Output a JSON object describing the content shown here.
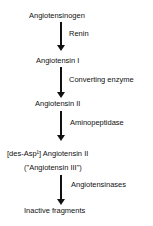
{
  "diagram": {
    "nodes": [
      {
        "id": "angiotensinogen",
        "label": "Angiotensinogen"
      },
      {
        "id": "angiotensin-1",
        "label": "Angiotensin I"
      },
      {
        "id": "angiotensin-2",
        "label": "Angiotensin II"
      },
      {
        "id": "des-asp-angiotensin-2",
        "label": "[des-Asp¹] Angiotensin II",
        "alias": "(\"Angiotensin III\")"
      },
      {
        "id": "inactive-fragments",
        "label": "Inactive fragments"
      }
    ],
    "edges": [
      {
        "from": "angiotensinogen",
        "to": "angiotensin-1",
        "label": "Renin"
      },
      {
        "from": "angiotensin-1",
        "to": "angiotensin-2",
        "label": "Converting enzyme"
      },
      {
        "from": "angiotensin-2",
        "to": "des-asp-angiotensin-2",
        "label": "Aminopeptidase"
      },
      {
        "from": "des-asp-angiotensin-2",
        "to": "inactive-fragments",
        "label": "Angiotensinases"
      }
    ]
  }
}
